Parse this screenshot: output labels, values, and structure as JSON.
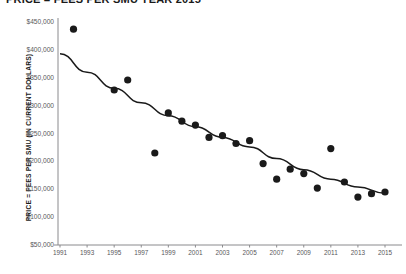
{
  "chart_data": {
    "type": "scatter",
    "title": "PRICE = FEES PER SMU YEAR 2015",
    "xlabel": "",
    "ylabel": "PRICE = FEES PER SMU (IN CURRENT DOLLARS)",
    "xlim": [
      1991,
      2015
    ],
    "ylim": [
      50000,
      450000
    ],
    "grid": false,
    "legend": null,
    "y_ticks": [
      {
        "value": 450000,
        "label": "$450,000"
      },
      {
        "value": 400000,
        "label": "$400,000"
      },
      {
        "value": 350000,
        "label": "$350,000"
      },
      {
        "value": 300000,
        "label": "$300,000"
      },
      {
        "value": 250000,
        "label": "$250,000"
      },
      {
        "value": 200000,
        "label": "$200,000"
      },
      {
        "value": 150000,
        "label": "$150,000"
      },
      {
        "value": 100000,
        "label": "$100,000"
      },
      {
        "value": 50000,
        "label": "$50,000"
      }
    ],
    "x_ticks": [
      {
        "value": 1991,
        "label": "1991"
      },
      {
        "value": 1993,
        "label": "1993"
      },
      {
        "value": 1995,
        "label": "1995"
      },
      {
        "value": 1997,
        "label": "1997"
      },
      {
        "value": 1999,
        "label": "1999"
      },
      {
        "value": 2001,
        "label": "2001"
      },
      {
        "value": 2003,
        "label": "2003"
      },
      {
        "value": 2005,
        "label": "2005"
      },
      {
        "value": 2007,
        "label": "2007"
      },
      {
        "value": 2009,
        "label": "2009"
      },
      {
        "value": 2011,
        "label": "2011"
      },
      {
        "value": 2013,
        "label": "2013"
      },
      {
        "value": 2015,
        "label": "2015"
      }
    ],
    "x": [
      1992,
      1995,
      1996,
      1998,
      1999,
      2000,
      2001,
      2002,
      2003,
      2004,
      2005,
      2006,
      2007,
      2008,
      2009,
      2010,
      2011,
      2012,
      2013,
      2014,
      2015
    ],
    "values": [
      437000,
      328000,
      346000,
      215000,
      287000,
      272000,
      265000,
      243000,
      246000,
      232000,
      237000,
      196000,
      168000,
      186000,
      178000,
      152000,
      223000,
      163000,
      136000,
      142000,
      145000
    ],
    "series": [
      {
        "name": "Price per SMU",
        "x": [
          1992,
          1995,
          1996,
          1998,
          1999,
          2000,
          2001,
          2002,
          2003,
          2004,
          2005,
          2006,
          2007,
          2008,
          2009,
          2010,
          2011,
          2012,
          2013,
          2014,
          2015
        ],
        "values": [
          437000,
          328000,
          346000,
          215000,
          287000,
          272000,
          265000,
          243000,
          246000,
          232000,
          237000,
          196000,
          168000,
          186000,
          178000,
          152000,
          223000,
          163000,
          136000,
          142000,
          145000
        ]
      },
      {
        "name": "Fitted trend",
        "type": "line",
        "x": [
          1991,
          1993,
          1995,
          1997,
          1999,
          2001,
          2003,
          2005,
          2007,
          2009,
          2011,
          2013,
          2015
        ],
        "values": [
          393000,
          360000,
          331000,
          305000,
          282000,
          262000,
          243000,
          226000,
          205000,
          185000,
          168000,
          154000,
          143000
        ]
      }
    ]
  },
  "colors": {
    "marker": "#1a1a1a",
    "trend": "#1a1a1a",
    "axis": "#8a8a8d",
    "tick_text": "#58585a",
    "title_text": "#1a1a1a",
    "background": "#ffffff"
  }
}
